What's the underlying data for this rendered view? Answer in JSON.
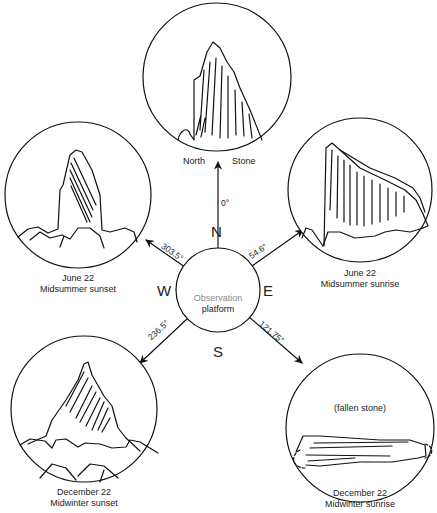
{
  "center": {
    "label_line1": "Observation",
    "label_line2": "platform",
    "directions": {
      "north": "N",
      "south": "S",
      "east": "E",
      "west": "W"
    }
  },
  "bearings": [
    {
      "id": "north",
      "angle": "0°"
    },
    {
      "id": "midsummer-sunrise",
      "angle": "54.6°"
    },
    {
      "id": "midwinter-sunrise",
      "angle": "121.75°"
    },
    {
      "id": "midwinter-sunset",
      "angle": "236.5°"
    },
    {
      "id": "midsummer-sunset",
      "angle": "303.5°"
    }
  ],
  "views": {
    "north": {
      "label_left": "North",
      "label_right": "Stone"
    },
    "midsummer_sunset": {
      "date": "June 22",
      "event": "Midsummer sunset"
    },
    "midsummer_sunrise": {
      "date": "June 22",
      "event": "Midsummer sunrise"
    },
    "midwinter_sunset": {
      "date": "December 22",
      "event": "Midwinter sunset"
    },
    "midwinter_sunrise": {
      "date": "December 22",
      "event": "Midwinter sunrise",
      "note": "(fallen stone)"
    }
  }
}
